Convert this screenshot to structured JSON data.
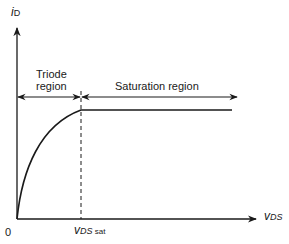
{
  "diagram": {
    "y_axis": {
      "symbol": "i",
      "subscript": "D"
    },
    "x_axis": {
      "symbol": "v",
      "subscript": "DS"
    },
    "origin_label": "0",
    "vdssat_label": {
      "symbol": "v",
      "subscript_italic": "DS",
      "subscript_plain": " sat"
    },
    "regions": [
      {
        "name": "triode",
        "label_line1": "Triode",
        "label_line2": "region"
      },
      {
        "name": "saturation",
        "label": "Saturation region"
      }
    ],
    "colors": {
      "ink": "#1a1a1a",
      "background": "#ffffff"
    }
  }
}
